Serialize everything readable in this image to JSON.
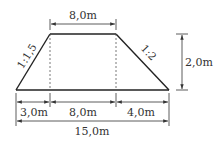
{
  "diagram": {
    "type": "trapezoid-cross-section",
    "colors": {
      "line": "#222222",
      "dim": "#333333",
      "dashed": "#555555",
      "background": "#ffffff"
    },
    "top_width": {
      "label": "8,0m"
    },
    "height": {
      "label": "2,0m"
    },
    "left_slope": {
      "label": "1:1,5"
    },
    "right_slope": {
      "label": "1:2"
    },
    "bottom_segments": [
      {
        "label": "3,0m"
      },
      {
        "label": "8,0m"
      },
      {
        "label": "4,0m"
      }
    ],
    "total_width": {
      "label": "15,0m"
    }
  }
}
